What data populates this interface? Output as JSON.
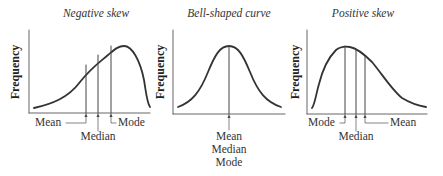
{
  "diagram": {
    "panels": [
      {
        "id": "negative-skew",
        "title": "Negative skew",
        "ylabel": "Frequency",
        "markers": {
          "left": "Mean",
          "middle": "Median",
          "right": "Mode"
        }
      },
      {
        "id": "bell-shaped",
        "title": "Bell-shaped curve",
        "ylabel": "Frequency",
        "markers": {
          "line1": "Mean",
          "line2": "Median",
          "line3": "Mode"
        }
      },
      {
        "id": "positive-skew",
        "title": "Positive skew",
        "ylabel": "Frequency",
        "markers": {
          "left": "Mode",
          "middle": "Median",
          "right": "Mean"
        }
      }
    ],
    "colors": {
      "curve": "#333333",
      "axis": "#555555",
      "text": "#333333"
    }
  }
}
